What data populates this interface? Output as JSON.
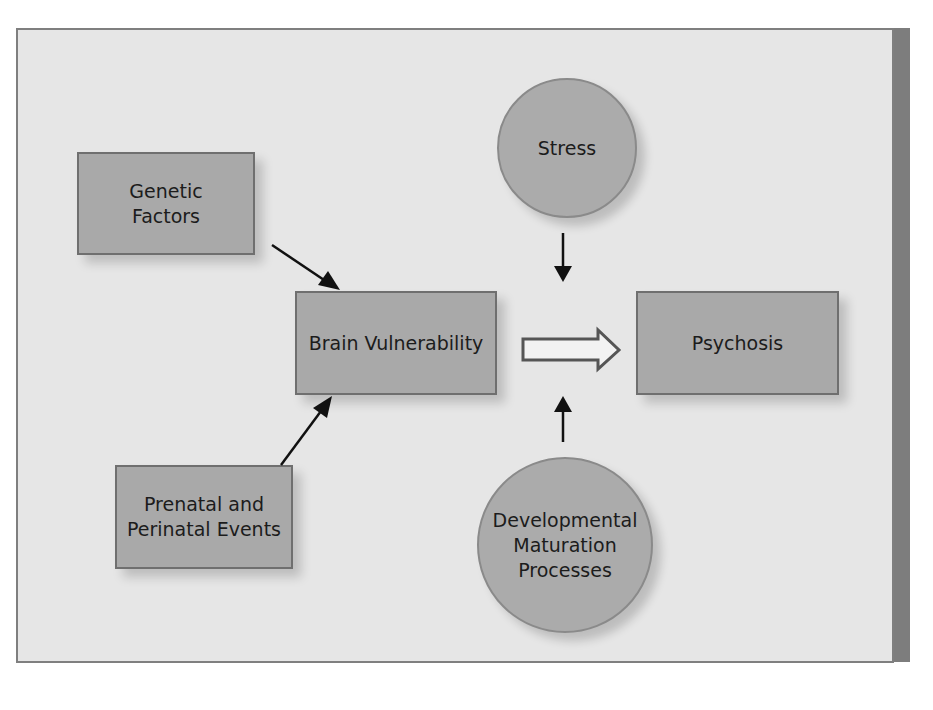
{
  "diagram": {
    "nodes": {
      "genetic_factors": {
        "label": "Genetic\nFactors",
        "shape": "rectangle"
      },
      "brain_vulnerability": {
        "label": "Brain Vulnerability",
        "shape": "rectangle"
      },
      "psychosis": {
        "label": "Psychosis",
        "shape": "rectangle"
      },
      "prenatal_events": {
        "label": "Prenatal and\nPerinatal Events",
        "shape": "rectangle"
      },
      "stress": {
        "label": "Stress",
        "shape": "circle"
      },
      "developmental_maturation": {
        "label": "Developmental\nMaturation\nProcesses",
        "shape": "circle"
      }
    },
    "edges": [
      {
        "from": "Genetic Factors",
        "to": "Brain Vulnerability",
        "style": "solid-arrow"
      },
      {
        "from": "Prenatal and Perinatal Events",
        "to": "Brain Vulnerability",
        "style": "solid-arrow"
      },
      {
        "from": "Brain Vulnerability",
        "to": "Psychosis",
        "style": "hollow-block-arrow"
      },
      {
        "from": "Stress",
        "to": "Brain Vulnerability → Psychosis",
        "style": "solid-arrow-down"
      },
      {
        "from": "Developmental Maturation Processes",
        "to": "Brain Vulnerability → Psychosis",
        "style": "solid-arrow-up"
      }
    ],
    "colors": {
      "panel_background": "#e6e6e6",
      "panel_border": "#7f7f7f",
      "node_fill": "#a9a9a9",
      "node_border": "#6f6f6f",
      "side_strip": "#7d7d7d",
      "arrow": "#111111"
    }
  }
}
